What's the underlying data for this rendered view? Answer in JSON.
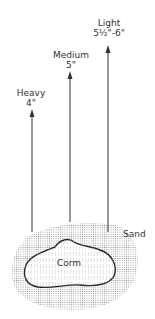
{
  "diagram": {
    "arrows": [
      {
        "name": "heavy",
        "soil": "Heavy",
        "depth": "4\""
      },
      {
        "name": "medium",
        "soil": "Medium",
        "depth": "5\""
      },
      {
        "name": "light",
        "soil": "Light",
        "depth": "5½\"-6\""
      }
    ],
    "sand_label": "Sand",
    "corm_label": "Corm",
    "colors": {
      "line": "#333333",
      "sand_dots": "#8a8a8a",
      "corm_fill": "#ffffff"
    }
  }
}
